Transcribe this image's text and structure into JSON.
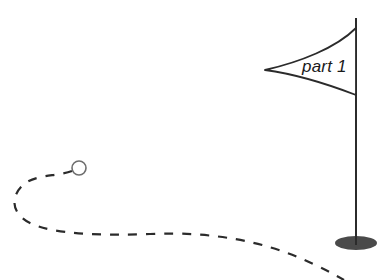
{
  "illustration": {
    "title": "golf-flag-and-ball-path",
    "background_color": "#ffffff",
    "ink_color": "#2b2b2b",
    "hole_color": "#4a4a4a"
  },
  "flag": {
    "label": "part 1",
    "label_style": "italic",
    "pole": {
      "x": 356,
      "top_y": 18,
      "bottom_y": 245,
      "color": "#2b2b2b",
      "width_px": 2
    },
    "banner": {
      "tip_x": 265,
      "tip_y": 70,
      "upper_attach_y": 28,
      "lower_attach_y": 95,
      "fill": "#ffffff",
      "stroke": "#2b2b2b"
    }
  },
  "hole": {
    "name": "hole-marker",
    "center_x": 356,
    "center_y": 243,
    "radius_x": 21,
    "radius_y": 7,
    "color": "#4a4a4a"
  },
  "ball": {
    "name": "golf-ball",
    "center_x": 79,
    "center_y": 168,
    "radius": 7,
    "fill": "#ffffff",
    "stroke": "#6e6e6e"
  },
  "path": {
    "name": "ball-trajectory",
    "style": "dashed",
    "dash_pattern": "9 9",
    "stroke": "#2b2b2b",
    "stroke_width": 2.2,
    "description": "curved dashed trajectory looping left from the ball then sweeping right and off the bottom-right edge",
    "d": "M 72 171 C 55 177, 34 174, 22 186 C 10 198, 12 214, 30 223 C 52 234, 100 236, 150 234 C 215 231, 265 243, 300 258 C 322 268, 334 274, 344 280"
  }
}
